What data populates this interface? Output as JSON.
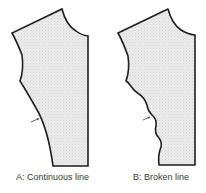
{
  "figure": {
    "panels": [
      {
        "id": "A",
        "caption": "A: Continuous line",
        "style": "continuous"
      },
      {
        "id": "B",
        "caption": "B: Broken line",
        "style": "broken"
      }
    ]
  },
  "colors": {
    "outline": "#1e1e1e",
    "fill": "#e6e6e6",
    "arrow": "#555555",
    "caption": "#3a3a3a"
  }
}
